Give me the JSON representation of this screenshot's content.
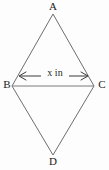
{
  "figure": {
    "kind": "geometry-diagram",
    "shape_name": "rhombus",
    "background_color": "#fdfdfd",
    "stroke_color": "#6e6e6e",
    "text_color": "#1a1a1a",
    "vertices": [
      {
        "id": "A",
        "label": "A",
        "x": 53,
        "y": 14,
        "label_position": "top"
      },
      {
        "id": "B",
        "label": "B",
        "x": 12,
        "y": 86,
        "label_position": "left"
      },
      {
        "id": "C",
        "label": "C",
        "x": 94,
        "y": 86,
        "label_position": "right"
      },
      {
        "id": "D",
        "label": "D",
        "x": 53,
        "y": 155,
        "label_position": "bottom"
      }
    ],
    "edges": [
      {
        "from": "A",
        "to": "C"
      },
      {
        "from": "C",
        "to": "D"
      },
      {
        "from": "D",
        "to": "B"
      },
      {
        "from": "B",
        "to": "A"
      }
    ],
    "diagonals": [
      {
        "from": "B",
        "to": "C",
        "drawn": true
      }
    ],
    "dimension": {
      "label": "x in",
      "variable": "x",
      "unit": "in",
      "measures": "BC",
      "arrow_style": "double-headed",
      "arrow_start_x": 19,
      "arrow_end_x": 88,
      "arrow_y": 76
    }
  }
}
